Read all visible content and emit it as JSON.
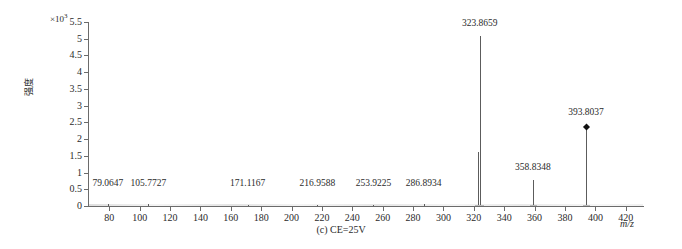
{
  "figure": {
    "caption": "(c) CE=25V"
  },
  "chart_data": {
    "type": "bar",
    "title": "",
    "subtitle": "",
    "caption": "(c) CE=25V",
    "xlabel": "m/z",
    "ylabel": "强度",
    "y_exponent_text": "×10",
    "y_exponent_power": "3",
    "y_scale_factor": 1000,
    "xlim": [
      66,
      432
    ],
    "ylim": [
      0,
      5.5
    ],
    "grid": false,
    "legend": null,
    "xticks": [
      80,
      100,
      120,
      140,
      160,
      180,
      200,
      220,
      240,
      260,
      280,
      300,
      320,
      340,
      360,
      380,
      400,
      420
    ],
    "xtick_labels": [
      "80",
      "100",
      "120",
      "140",
      "160",
      "180",
      "200",
      "220",
      "240",
      "260",
      "280",
      "300",
      "320",
      "340",
      "360",
      "380",
      "400",
      "420"
    ],
    "yticks": [
      0,
      0.5,
      1,
      1.5,
      2,
      2.5,
      3,
      3.5,
      4,
      4.5,
      5,
      5.5
    ],
    "ytick_labels": [
      "0",
      "0.5",
      "1",
      "1.5",
      "2",
      "2.5",
      "3",
      "3.5",
      "4",
      "4.5",
      "5",
      "5.5"
    ],
    "x": [
      79.0647,
      105.7727,
      171.1167,
      216.9588,
      253.9225,
      286.8934,
      322.6,
      323.8659,
      358.8348,
      393.8037
    ],
    "values": [
      0.05,
      0.05,
      0.04,
      0.04,
      0.04,
      0.05,
      1.62,
      5.08,
      0.78,
      2.37
    ],
    "annotations": [
      {
        "label": "79.0647",
        "mz": 79.0647,
        "intensity": 0.05,
        "label_y": 0.52,
        "marker": false
      },
      {
        "label": "105.7727",
        "mz": 105.7727,
        "intensity": 0.05,
        "label_y": 0.52,
        "marker": false
      },
      {
        "label": "171.1167",
        "mz": 171.1167,
        "intensity": 0.04,
        "label_y": 0.52,
        "marker": false
      },
      {
        "label": "216.9588",
        "mz": 216.9588,
        "intensity": 0.04,
        "label_y": 0.52,
        "marker": false
      },
      {
        "label": "253.9225",
        "mz": 253.9225,
        "intensity": 0.04,
        "label_y": 0.52,
        "marker": false
      },
      {
        "label": "286.8934",
        "mz": 286.8934,
        "intensity": 0.05,
        "label_y": 0.52,
        "marker": false
      },
      {
        "label": "323.8659",
        "mz": 323.8659,
        "intensity": 5.08,
        "label_y": 5.3,
        "marker": false
      },
      {
        "label": "358.8348",
        "mz": 358.8348,
        "intensity": 0.78,
        "label_y": 1.0,
        "marker": false
      },
      {
        "label": "393.8037",
        "mz": 393.8037,
        "intensity": 2.37,
        "label_y": 2.62,
        "marker": true
      }
    ],
    "marker_color": "#111111",
    "peak_color": "#5c5c5c",
    "axis_color": "#6b6b6b"
  }
}
